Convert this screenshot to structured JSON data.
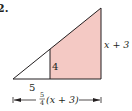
{
  "problem_number": "2.",
  "figure": {
    "type": "similar-triangles",
    "fill_color": "#f4c9c4",
    "stroke_color": "#231f20",
    "labels": {
      "small_height": "4",
      "small_base": "5",
      "large_height": "x + 3",
      "large_base_fraction_num": "5",
      "large_base_fraction_den": "4",
      "large_base_expr": "(x + 3)"
    }
  }
}
